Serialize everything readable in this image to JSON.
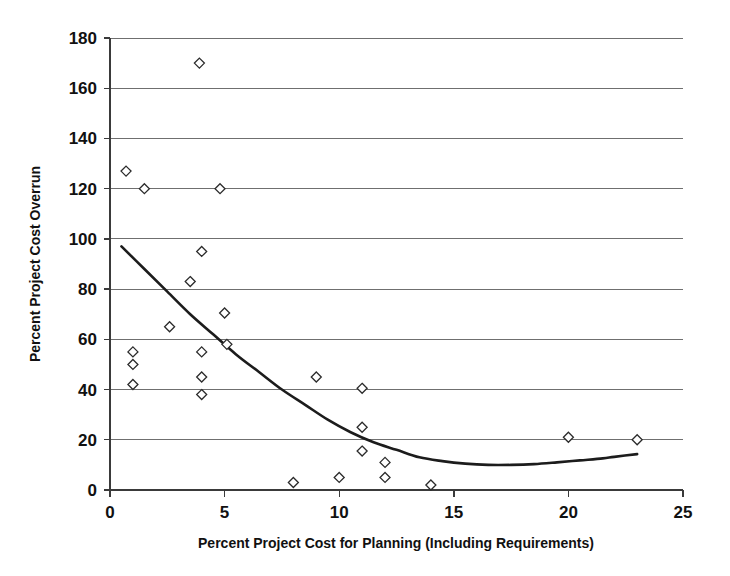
{
  "chart_data": {
    "type": "scatter",
    "title": "",
    "xlabel": "Percent Project Cost for Planning (Including Requirements)",
    "ylabel": "Percent Project Cost Overrun",
    "xlim": [
      0,
      25
    ],
    "ylim": [
      0,
      180
    ],
    "xticks": [
      0,
      5,
      10,
      15,
      20,
      25
    ],
    "yticks": [
      0,
      20,
      40,
      60,
      80,
      100,
      120,
      140,
      160,
      180
    ],
    "xtick_labels": [
      "0",
      "5",
      "10",
      "15",
      "20",
      "25"
    ],
    "ytick_labels": [
      "0",
      "20",
      "40",
      "60",
      "80",
      "100",
      "120",
      "140",
      "160",
      "180"
    ],
    "grid": "horizontal",
    "legend": "none",
    "marker_style": "open-diamond",
    "points": [
      {
        "x": 0.7,
        "y": 127
      },
      {
        "x": 1.0,
        "y": 55
      },
      {
        "x": 1.0,
        "y": 50
      },
      {
        "x": 1.0,
        "y": 42
      },
      {
        "x": 1.5,
        "y": 120
      },
      {
        "x": 2.6,
        "y": 65
      },
      {
        "x": 3.5,
        "y": 83
      },
      {
        "x": 3.9,
        "y": 170
      },
      {
        "x": 4.0,
        "y": 95
      },
      {
        "x": 4.0,
        "y": 55
      },
      {
        "x": 4.0,
        "y": 45
      },
      {
        "x": 4.0,
        "y": 38
      },
      {
        "x": 4.8,
        "y": 120
      },
      {
        "x": 5.0,
        "y": 70.5
      },
      {
        "x": 5.1,
        "y": 58
      },
      {
        "x": 8.0,
        "y": 3
      },
      {
        "x": 9.0,
        "y": 45
      },
      {
        "x": 10.0,
        "y": 5
      },
      {
        "x": 11.0,
        "y": 40.5
      },
      {
        "x": 11.0,
        "y": 25
      },
      {
        "x": 11.0,
        "y": 15.5
      },
      {
        "x": 12.0,
        "y": 11
      },
      {
        "x": 12.0,
        "y": 5
      },
      {
        "x": 14.0,
        "y": 2
      },
      {
        "x": 20.0,
        "y": 21
      },
      {
        "x": 23.0,
        "y": 20
      }
    ],
    "trendline": {
      "type": "quadratic-fit",
      "points": [
        {
          "x": 0.5,
          "y": 97
        },
        {
          "x": 1.5,
          "y": 88
        },
        {
          "x": 2.5,
          "y": 79
        },
        {
          "x": 3.5,
          "y": 70
        },
        {
          "x": 4.5,
          "y": 62
        },
        {
          "x": 5.5,
          "y": 54
        },
        {
          "x": 6.5,
          "y": 47
        },
        {
          "x": 7.5,
          "y": 40
        },
        {
          "x": 8.5,
          "y": 34
        },
        {
          "x": 9.5,
          "y": 28
        },
        {
          "x": 10.5,
          "y": 23
        },
        {
          "x": 11.5,
          "y": 19
        },
        {
          "x": 12.5,
          "y": 16
        },
        {
          "x": 13.5,
          "y": 13
        },
        {
          "x": 14.5,
          "y": 11.5
        },
        {
          "x": 15.5,
          "y": 10.5
        },
        {
          "x": 16.5,
          "y": 10
        },
        {
          "x": 17.5,
          "y": 10
        },
        {
          "x": 18.5,
          "y": 10.3
        },
        {
          "x": 19.5,
          "y": 11
        },
        {
          "x": 20.5,
          "y": 11.8
        },
        {
          "x": 21.5,
          "y": 12.6
        },
        {
          "x": 22.0,
          "y": 13.2
        },
        {
          "x": 23.0,
          "y": 14.3
        }
      ]
    },
    "colors": {
      "marker_stroke": "#2b2b2b",
      "marker_fill": "#ffffff",
      "trendline": "#1c1c1c",
      "gridline": "#6f6f6f",
      "axis": "#3a3a3a",
      "background": "#ffffff",
      "text": "#111111"
    }
  }
}
